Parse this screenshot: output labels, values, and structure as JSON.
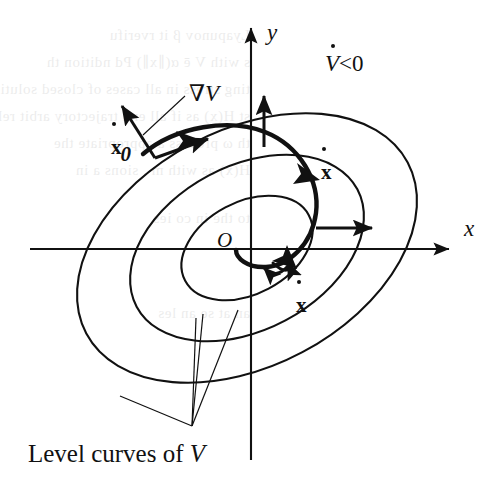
{
  "figure": {
    "background_color": "#ffffff",
    "ink_color": "#111111",
    "width": 503,
    "height": 493
  },
  "axes": {
    "x_label": "x",
    "y_label": "y",
    "origin_label": "O"
  },
  "annotations": {
    "vdot_negative": {
      "symbol": "V",
      "relation": "<0",
      "full_text": "V̇<0"
    },
    "gradient_label": {
      "nabla": "∇",
      "symbol": "V",
      "full_text": "∇V"
    },
    "initial_state": {
      "symbol": "x",
      "subscript": "0",
      "full_text": "ẋ0"
    },
    "state_derivative_upper": {
      "symbol": "x",
      "full_text": "ẋ"
    },
    "state_derivative_lower": {
      "symbol": "x",
      "full_text": "ẋ"
    },
    "caption": {
      "text_before": "Level curves of ",
      "symbol": "V",
      "full_text": "Level curves of V"
    }
  },
  "level_curves": [
    {
      "name": "outer-level-curve",
      "rx": 182,
      "ry": 118,
      "cx": 247,
      "cy": 248,
      "rotation_deg": -28
    },
    {
      "name": "middle-level-curve",
      "rx": 125,
      "ry": 82,
      "cx": 247,
      "cy": 248,
      "rotation_deg": -28
    },
    {
      "name": "inner-level-curve",
      "rx": 70,
      "ry": 46,
      "cx": 247,
      "cy": 248,
      "rotation_deg": -28
    }
  ],
  "vectors": [
    {
      "name": "gradient-vector-at-x0",
      "kind": "gradient",
      "description": "outward normal arrow at initial point"
    },
    {
      "name": "velocity-vector-at-x0",
      "kind": "velocity",
      "description": "tangent arrow along trajectory at initial point"
    },
    {
      "name": "gradient-vector-top",
      "kind": "gradient",
      "description": "vertical outward normal near y-axis"
    },
    {
      "name": "gradient-vector-right",
      "kind": "gradient",
      "description": "horizontal outward normal on the right"
    },
    {
      "name": "velocity-vector-upper",
      "kind": "velocity",
      "description": "trajectory arrow labelled x-dot, upper right"
    },
    {
      "name": "velocity-vector-lower",
      "kind": "velocity",
      "description": "trajectory arrow labelled x-dot, lower"
    }
  ],
  "trajectory": {
    "name": "inward-spiral-trajectory",
    "description": "thick spiral curve starting at x0 and winding inward toward the origin"
  },
  "leader_lines": {
    "name": "caption-leader-lines",
    "count": 3,
    "description": "three thin lines from the caption apex to each level curve"
  },
  "ghost_text": {
    "note": "faint show-through text from the reverse of the scanned page",
    "lines": [
      "Lyapunov β it rverifu",
      "s with V ē α(∥x∥) Pd ndition  th",
      "ting stress in all cases of closed  solution",
      "st H(x) as if all end trajectory arbit  rel-",
      "th ω process a appropriate  the",
      "H(x) as with  m  .  sions  a  in",
      "to  the  in  co  ies",
      "an  at  se  an  les"
    ]
  }
}
